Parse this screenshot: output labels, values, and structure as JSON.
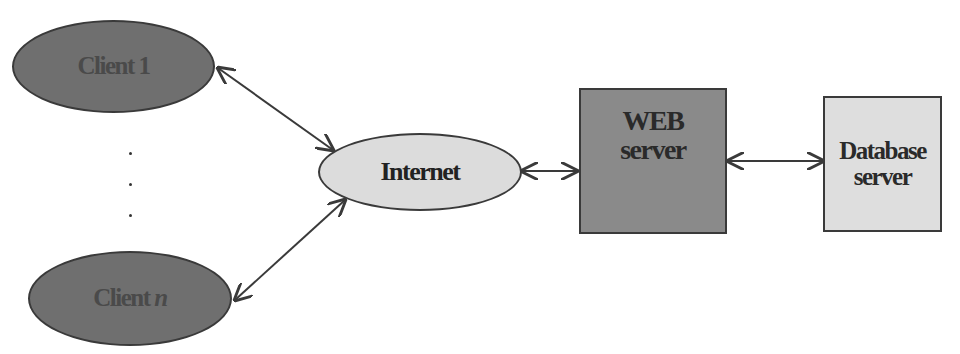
{
  "diagram": {
    "type": "client-server architecture",
    "nodes": {
      "client_1": {
        "label": "Client 1",
        "shape": "ellipse",
        "fill": "#6f6f6f"
      },
      "client_n": {
        "label_prefix": "Client ",
        "label_var": "n",
        "shape": "ellipse",
        "fill": "#6f6f6f"
      },
      "internet": {
        "label": "Internet",
        "shape": "ellipse",
        "fill": "#dcdcdc"
      },
      "web_server": {
        "line1": "WEB",
        "line2": "server",
        "shape": "rectangle",
        "fill": "#8a8a8a"
      },
      "database_server": {
        "line1": "Database",
        "line2": "server",
        "shape": "rectangle",
        "fill": "#dedede"
      }
    },
    "ellipsis": "vertical dots between Client 1 and Client n",
    "edges": [
      {
        "from": "client_1",
        "to": "internet",
        "type": "bidirectional-arrow"
      },
      {
        "from": "client_n",
        "to": "internet",
        "type": "bidirectional-arrow"
      },
      {
        "from": "internet",
        "to": "web_server",
        "type": "bidirectional-arrow"
      },
      {
        "from": "web_server",
        "to": "database_server",
        "type": "bidirectional-arrow"
      }
    ],
    "colors": {
      "stroke": "#3a3a3a",
      "background": "#ffffff"
    }
  }
}
